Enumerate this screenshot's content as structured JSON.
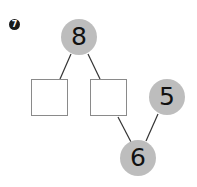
{
  "problem_number": "7",
  "diagram": {
    "type": "number-bond",
    "nodes": [
      {
        "id": "top",
        "value": "8",
        "shape": "circle"
      },
      {
        "id": "left-box",
        "value": "",
        "shape": "square"
      },
      {
        "id": "right-box",
        "value": "",
        "shape": "square"
      },
      {
        "id": "right-circle",
        "value": "5",
        "shape": "circle"
      },
      {
        "id": "bottom",
        "value": "6",
        "shape": "circle"
      }
    ],
    "edges": [
      [
        "top",
        "left-box"
      ],
      [
        "top",
        "right-box"
      ],
      [
        "right-box",
        "bottom"
      ],
      [
        "right-circle",
        "bottom"
      ]
    ]
  },
  "colors": {
    "circle_fill": "#bdbdbd",
    "line": "#333333",
    "box_border": "#8a8a8a"
  }
}
